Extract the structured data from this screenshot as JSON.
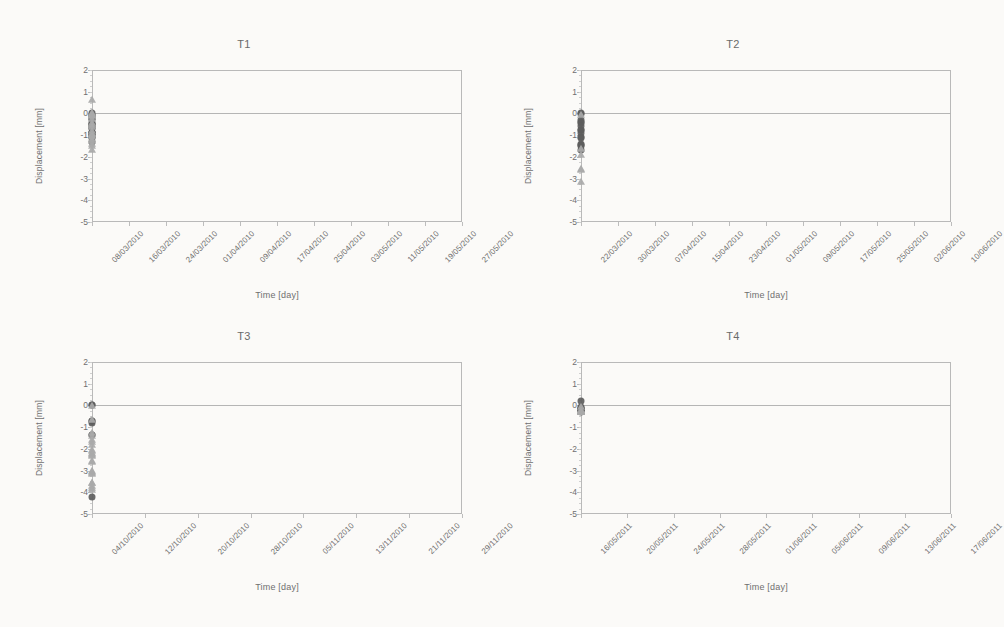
{
  "figure": {
    "panels_order": [
      "T1",
      "T2",
      "T3",
      "T4"
    ]
  },
  "axis": {
    "ylabel": "Displacement [mm]",
    "xlabel": "Time [day]",
    "yticks": [
      "2",
      "1",
      "0",
      "-1",
      "-2",
      "-3",
      "-4",
      "-5"
    ]
  },
  "colors": {
    "circle_series": "#5d5d5d",
    "triangle_series": "#a9a9a9",
    "frame": "#b9b9b9",
    "text": "#6f6f6f",
    "background": "#fbfaf8"
  },
  "chart_data": [
    {
      "type": "scatter",
      "title": "T1",
      "xlabel": "Time [day]",
      "ylabel": "Displacement [mm]",
      "ylim": [
        -5,
        2
      ],
      "grid": false,
      "legend": "none",
      "xticklabels": [
        "08/03/2010",
        "16/03/2010",
        "24/03/2010",
        "01/04/2010",
        "09/04/2010",
        "17/04/2010",
        "25/04/2010",
        "03/05/2010",
        "11/05/2010",
        "19/05/2010",
        "27/05/2010"
      ],
      "xlim_days": [
        0,
        80
      ],
      "series": [
        {
          "name": "circles",
          "marker": "circle",
          "points": [
            [
              0.3,
              0.02
            ],
            [
              0.9,
              -0.05
            ],
            [
              1.6,
              -0.12
            ],
            [
              2.2,
              -0.1
            ],
            [
              8.2,
              -0.25
            ],
            [
              16.3,
              -0.25
            ],
            [
              27.0,
              -0.45
            ],
            [
              27.8,
              -0.5
            ],
            [
              28.6,
              -0.52
            ],
            [
              29.4,
              -0.55
            ],
            [
              37.2,
              -0.65
            ],
            [
              38.0,
              -0.68
            ],
            [
              44.6,
              -0.88
            ],
            [
              45.4,
              -0.85
            ],
            [
              46.0,
              -0.95
            ],
            [
              46.6,
              -0.9
            ],
            [
              53.5,
              -0.88
            ],
            [
              63.0,
              -1.08
            ],
            [
              63.9,
              -1.05
            ],
            [
              64.6,
              -1.12
            ],
            [
              72.2,
              -1.32
            ]
          ]
        },
        {
          "name": "triangles",
          "marker": "triangle",
          "points": [
            [
              22.4,
              -0.95
            ],
            [
              24.0,
              -0.42
            ],
            [
              25.6,
              -0.52
            ],
            [
              30.4,
              0.62
            ],
            [
              33.0,
              -0.06
            ],
            [
              34.4,
              -0.02
            ],
            [
              35.2,
              -0.08
            ],
            [
              36.0,
              0.02
            ],
            [
              36.8,
              -0.12
            ],
            [
              37.8,
              -0.25
            ],
            [
              38.8,
              -0.08
            ],
            [
              41.0,
              -0.62
            ],
            [
              42.6,
              -0.82
            ],
            [
              43.8,
              -0.95
            ],
            [
              44.8,
              -1.02
            ],
            [
              46.4,
              -1.25
            ],
            [
              47.6,
              -1.42
            ],
            [
              48.8,
              -1.68
            ],
            [
              51.0,
              -1.02
            ],
            [
              57.0,
              -1.18
            ],
            [
              64.8,
              -1.48
            ]
          ]
        }
      ]
    },
    {
      "type": "scatter",
      "title": "T2",
      "xlabel": "Time [day]",
      "ylabel": "Displacement [mm]",
      "ylim": [
        -5,
        2
      ],
      "grid": false,
      "legend": "none",
      "xticklabels": [
        "22/03/2010",
        "30/03/2010",
        "07/04/2010",
        "15/04/2010",
        "23/04/2010",
        "01/05/2010",
        "09/05/2010",
        "17/05/2010",
        "25/05/2010",
        "02/06/2010",
        "10/06/2010"
      ],
      "xlim_days": [
        0,
        80
      ],
      "series": [
        {
          "name": "circles",
          "marker": "circle",
          "points": [
            [
              0.6,
              0.0
            ],
            [
              1.4,
              -0.02
            ],
            [
              17.4,
              -0.32
            ],
            [
              18.2,
              -0.38
            ],
            [
              19.0,
              -0.42
            ],
            [
              25.4,
              -0.58
            ],
            [
              33.0,
              -0.78
            ],
            [
              34.0,
              -0.78
            ],
            [
              40.6,
              -0.88
            ],
            [
              48.6,
              -1.08
            ],
            [
              49.6,
              -1.12
            ],
            [
              56.6,
              -1.42
            ],
            [
              57.4,
              -1.45
            ],
            [
              65.0,
              -1.52
            ],
            [
              74.2,
              -1.68
            ]
          ]
        },
        {
          "name": "triangles",
          "marker": "triangle",
          "points": [
            [
              0.0,
              -0.05
            ],
            [
              57.2,
              -1.62
            ],
            [
              58.2,
              -2.58
            ],
            [
              70.4,
              -2.62
            ],
            [
              71.2,
              -3.15
            ],
            [
              72.8,
              -1.92
            ]
          ]
        }
      ]
    },
    {
      "type": "scatter",
      "title": "T3",
      "xlabel": "Time [day]",
      "ylabel": "Displacement [mm]",
      "ylim": [
        -5,
        2
      ],
      "grid": false,
      "legend": "none",
      "xticklabels": [
        "04/10/2010",
        "12/10/2010",
        "20/10/2010",
        "28/10/2010",
        "05/11/2010",
        "13/11/2010",
        "21/11/2010",
        "29/11/2010"
      ],
      "xlim_days": [
        0,
        58
      ],
      "series": [
        {
          "name": "circles",
          "marker": "circle",
          "points": [
            [
              0.3,
              0.0
            ],
            [
              6.2,
              0.0
            ],
            [
              14.2,
              -0.72
            ],
            [
              14.6,
              -0.8
            ],
            [
              22.2,
              -0.7
            ],
            [
              31.0,
              -1.35
            ],
            [
              32.2,
              -1.38
            ],
            [
              55.8,
              -4.2
            ]
          ]
        },
        {
          "name": "triangles",
          "marker": "triangle",
          "points": [
            [
              1.6,
              -0.02
            ],
            [
              10.4,
              -1.42
            ],
            [
              14.4,
              -0.68
            ],
            [
              18.6,
              -1.28
            ],
            [
              21.0,
              -1.7
            ],
            [
              21.8,
              -1.82
            ],
            [
              22.6,
              -2.58
            ],
            [
              23.4,
              -2.62
            ],
            [
              25.6,
              -1.58
            ],
            [
              30.0,
              -2.25
            ],
            [
              30.8,
              -2.18
            ],
            [
              31.6,
              -2.32
            ],
            [
              32.4,
              -2.12
            ],
            [
              33.2,
              -2.3
            ],
            [
              33.8,
              -2.05
            ],
            [
              35.6,
              -3.58
            ],
            [
              36.6,
              -3.72
            ],
            [
              37.4,
              -3.78
            ],
            [
              38.2,
              -3.88
            ],
            [
              39.4,
              -3.02
            ],
            [
              40.4,
              -3.05
            ],
            [
              44.0,
              -3.18
            ],
            [
              51.0,
              -3.12
            ],
            [
              52.2,
              -3.55
            ]
          ]
        }
      ]
    },
    {
      "type": "scatter",
      "title": "T4",
      "xlabel": "Time [day]",
      "ylabel": "Displacement [mm]",
      "ylim": [
        -5,
        2
      ],
      "grid": false,
      "legend": "none",
      "xticklabels": [
        "16/05/2011",
        "20/05/2011",
        "24/05/2011",
        "28/05/2011",
        "01/06/2011",
        "05/06/2011",
        "09/06/2011",
        "13/06/2011",
        "17/06/2011"
      ],
      "xlim_days": [
        0,
        33
      ],
      "series": [
        {
          "name": "circles",
          "marker": "circle",
          "points": [
            [
              0.2,
              0.22
            ],
            [
              3.2,
              -0.18
            ],
            [
              15.8,
              -0.22
            ],
            [
              16.6,
              -0.2
            ],
            [
              17.4,
              -0.18
            ],
            [
              21.2,
              -0.12
            ],
            [
              25.4,
              -0.28
            ],
            [
              26.0,
              -0.22
            ],
            [
              32.0,
              -0.05
            ]
          ]
        },
        {
          "name": "triangles",
          "marker": "triangle",
          "points": [
            [
              0.2,
              -0.05
            ],
            [
              11.6,
              -0.25
            ],
            [
              15.0,
              -0.22
            ],
            [
              16.2,
              -0.3
            ],
            [
              17.8,
              -0.32
            ],
            [
              20.2,
              -0.3
            ],
            [
              23.8,
              -0.32
            ],
            [
              25.0,
              -0.3
            ],
            [
              26.2,
              -0.26
            ],
            [
              27.4,
              -0.3
            ],
            [
              28.8,
              -0.3
            ],
            [
              30.0,
              -0.3
            ]
          ]
        }
      ]
    }
  ]
}
